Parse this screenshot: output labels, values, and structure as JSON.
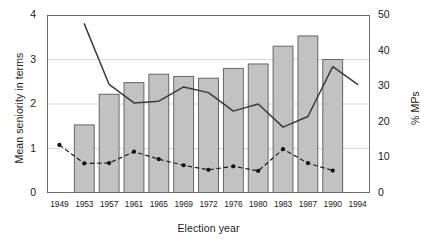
{
  "chart_data": {
    "type": "bar",
    "title": "",
    "subtitle": "",
    "xlabel": "Election year",
    "ylabel": "Mean seniority in terms",
    "ylabel_secondary": "% MPs",
    "categories": [
      "1949",
      "1953",
      "1957",
      "1961",
      "1965",
      "1969",
      "1972",
      "1976",
      "1980",
      "1983",
      "1987",
      "1990",
      "1994"
    ],
    "ylim": [
      0,
      4
    ],
    "yticks": [
      "0",
      "1",
      "2",
      "3",
      "4"
    ],
    "ytick_values": [
      0,
      1,
      2,
      3,
      4
    ],
    "ylim_secondary": [
      0,
      50
    ],
    "yticks_secondary": [
      "0",
      "10",
      "20",
      "30",
      "40",
      "50"
    ],
    "ytick_values_secondary": [
      0,
      10,
      20,
      30,
      40,
      50
    ],
    "grid": true,
    "legend": "none",
    "series": [
      {
        "name": "Mean seniority in terms",
        "type": "bar",
        "axis": "left",
        "color": "#c2c2c2",
        "edge_color": "#5a5a5a",
        "x": [
          "1953",
          "1957",
          "1961",
          "1965",
          "1969",
          "1972",
          "1976",
          "1980",
          "1983",
          "1987",
          "1990"
        ],
        "values": [
          1.53,
          2.22,
          2.48,
          2.67,
          2.62,
          2.58,
          2.8,
          2.9,
          3.3,
          3.53,
          3.0
        ]
      },
      {
        "name": "% MPs (solid)",
        "type": "line",
        "axis": "right",
        "color": "#3a3a3a",
        "style": "solid",
        "markers": false,
        "x": [
          "1953",
          "1957",
          "1961",
          "1965",
          "1969",
          "1972",
          "1976",
          "1980",
          "1983",
          "1987",
          "1990",
          "1994"
        ],
        "values": [
          47.5,
          30.5,
          25.3,
          25.8,
          29.8,
          28.2,
          23.0,
          25.0,
          18.5,
          21.5,
          35.5,
          30.5
        ]
      },
      {
        "name": "% MPs (dashed)",
        "type": "line",
        "axis": "right",
        "color": "#1a1a1a",
        "style": "dashed",
        "markers": true,
        "x": [
          "1949",
          "1953",
          "1957",
          "1961",
          "1965",
          "1969",
          "1972",
          "1976",
          "1980",
          "1983",
          "1987",
          "1990"
        ],
        "values": [
          13.5,
          8.3,
          8.4,
          11.6,
          9.5,
          7.8,
          6.5,
          7.5,
          6.2,
          12.3,
          8.4,
          6.3
        ]
      }
    ]
  }
}
